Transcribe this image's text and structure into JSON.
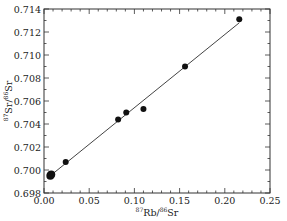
{
  "chart_data": {
    "type": "scatter",
    "title": "",
    "xlabel": "87Rb/86Sr",
    "ylabel": "87Sr/86Sr",
    "xlabel_parts": {
      "sup1": "87",
      "base1": "Rb/",
      "sup2": "86",
      "base2": "Sr"
    },
    "ylabel_parts": {
      "sup1": "87",
      "base1": "Sr/",
      "sup2": "86",
      "base2": "Sr"
    },
    "xlim": [
      0.0,
      0.25
    ],
    "ylim": [
      0.698,
      0.714
    ],
    "xticks": [
      "0.00",
      "0.05",
      "0.10",
      "0.15",
      "0.20",
      "0.25"
    ],
    "yticks": [
      "0.698",
      "0.700",
      "0.702",
      "0.704",
      "0.706",
      "0.708",
      "0.710",
      "0.712",
      "0.714"
    ],
    "grid": false,
    "legend": null,
    "series": [
      {
        "name": "samples",
        "kind": "scatter",
        "points": [
          {
            "x": 0.007,
            "y": 0.6995,
            "size": 4
          },
          {
            "x": 0.008,
            "y": 0.6996,
            "size": 4
          },
          {
            "x": 0.024,
            "y": 0.7007,
            "size": 3
          },
          {
            "x": 0.082,
            "y": 0.7044,
            "size": 3
          },
          {
            "x": 0.091,
            "y": 0.705,
            "size": 3
          },
          {
            "x": 0.11,
            "y": 0.7053,
            "size": 3
          },
          {
            "x": 0.156,
            "y": 0.709,
            "size": 3
          },
          {
            "x": 0.216,
            "y": 0.7131,
            "size": 3
          }
        ]
      },
      {
        "name": "isochron fit",
        "kind": "line",
        "points": [
          {
            "x": 0.007,
            "y": 0.6995
          },
          {
            "x": 0.216,
            "y": 0.7128
          }
        ]
      }
    ]
  },
  "colors": {
    "axis": "#333333",
    "points": "#111111",
    "line": "#444444"
  }
}
